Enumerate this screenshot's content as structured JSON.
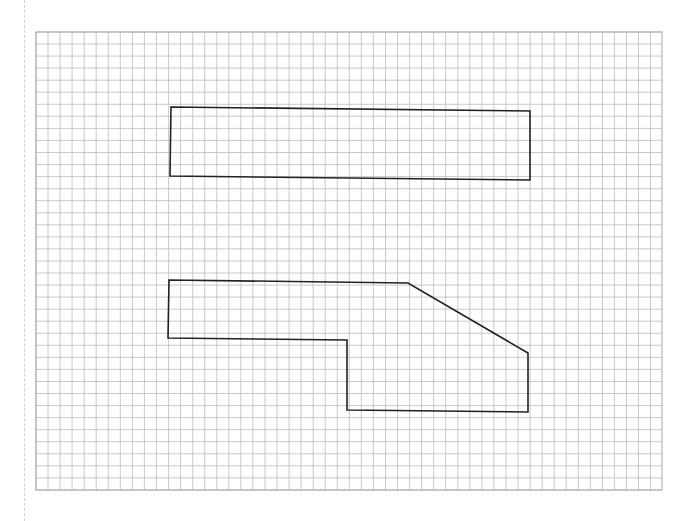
{
  "diagram": {
    "type": "graph-paper-shapes",
    "grid": {
      "left": 36,
      "top": 32,
      "right": 662,
      "bottom": 490,
      "cell": 12.05,
      "line_color": "#bdbdbd",
      "border_color": "#a8a8a8"
    },
    "stroke_color": "#222222",
    "shapes": [
      {
        "name": "rectangle",
        "points": [
          [
            171,
            107
          ],
          [
            530,
            111
          ],
          [
            530,
            180
          ],
          [
            170,
            176
          ]
        ]
      },
      {
        "name": "composite-polygon",
        "points": [
          [
            169,
            280
          ],
          [
            408,
            283
          ],
          [
            528,
            353
          ],
          [
            528,
            412
          ],
          [
            347,
            410
          ],
          [
            347,
            340
          ],
          [
            168,
            338
          ]
        ]
      }
    ]
  }
}
